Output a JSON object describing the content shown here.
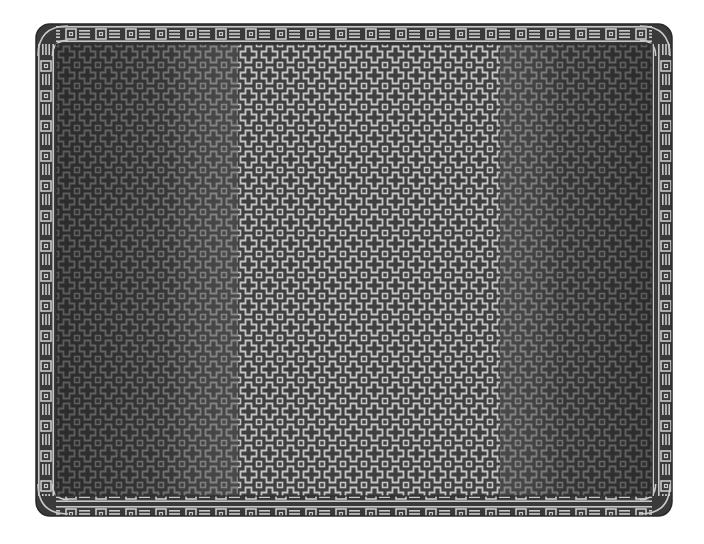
{
  "image": {
    "subject": "Rectangular blanket with cross-and-square mosaic pattern",
    "caption": "Mosaic blanket with patterned border",
    "width": 704,
    "height": 544
  },
  "blanket": {
    "outer": {
      "x": 36,
      "y": 24,
      "width": 636,
      "height": 492,
      "corner_radius": 14
    },
    "border_width": 20,
    "panels": [
      {
        "name": "left",
        "x_start": 56,
        "x_end": 238,
        "tone": "dark"
      },
      {
        "name": "center",
        "x_start": 238,
        "x_end": 500,
        "tone": "light"
      },
      {
        "name": "right",
        "x_start": 500,
        "x_end": 652,
        "tone": "dark"
      }
    ],
    "motif": "cross-and-square",
    "motif_period": 21,
    "border_motif": "square-box and triple-bar alternating",
    "border_period": 30
  },
  "colors": {
    "background": "#ffffff",
    "border_dark": "#3a3a3a",
    "border_light": "#c9c9c9",
    "side_dark": "#3d3d3d",
    "side_mid": "#4f4f4f",
    "side_motif": "#8a8a8a",
    "center_dark": "#3f3f3f",
    "center_light": "#c4c4c4"
  }
}
